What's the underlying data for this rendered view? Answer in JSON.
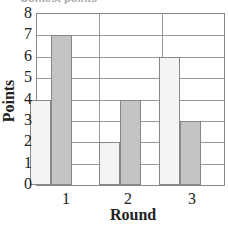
{
  "chart_data": {
    "type": "bar",
    "title": "Contest points",
    "xlabel": "Round",
    "ylabel": "Points",
    "categories": [
      "1",
      "2",
      "3"
    ],
    "series": [
      {
        "name": "Series A (light)",
        "color": "#f4f4f4",
        "values": [
          4,
          2,
          6
        ]
      },
      {
        "name": "Series B (gray)",
        "color": "#c4c4c4",
        "values": [
          7,
          4,
          3
        ]
      }
    ],
    "ylim": [
      0,
      8
    ],
    "yticks": [
      "0",
      "1",
      "2",
      "3",
      "4",
      "5",
      "6",
      "7",
      "8"
    ],
    "grid": true,
    "legend": "none"
  }
}
